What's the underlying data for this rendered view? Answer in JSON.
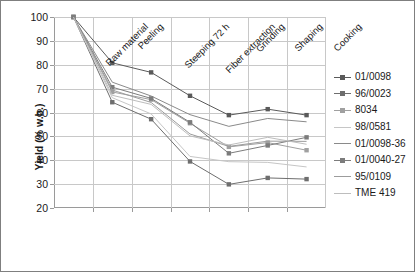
{
  "chart_data": {
    "type": "line",
    "title": "",
    "xlabel": "",
    "ylabel": "Yield (% w.b.)",
    "ylim": [
      20,
      100
    ],
    "ytick_step": 10,
    "yticks": [
      "100",
      "90",
      "80",
      "70",
      "60",
      "50",
      "40",
      "30",
      "20"
    ],
    "grid": true,
    "legend_position": "right",
    "categories": [
      "Raw material",
      "Peeling",
      "Steeping 72 h",
      "Fiber extraction",
      "Grinding",
      "Shaping",
      "Cooking"
    ],
    "series": [
      {
        "name": "01/0098",
        "color": "#5a5a5a",
        "marker": "square",
        "values": [
          100,
          80.8,
          76.8,
          67.0,
          58.9,
          61.4,
          58.9
        ]
      },
      {
        "name": "96/0023",
        "color": "#6e6e6e",
        "marker": "square",
        "values": [
          100,
          64.3,
          57.2,
          39.5,
          29.9,
          32.6,
          32.1
        ]
      },
      {
        "name": "8034",
        "color": "#a0a0a0",
        "marker": "square",
        "values": [
          100,
          68.6,
          65.4,
          55.5,
          45.6,
          47.4,
          44.2
        ]
      },
      {
        "name": "98/0581",
        "color": "#c6c6c6",
        "marker": "none",
        "values": [
          100,
          66.2,
          59.4,
          41.6,
          39.4,
          39.1,
          37.2
        ]
      },
      {
        "name": "01/0098-36",
        "color": "#8a8a8a",
        "marker": "none",
        "values": [
          100,
          72.7,
          66.9,
          59.1,
          54.2,
          57.5,
          56.1
        ]
      },
      {
        "name": "01/0040-27",
        "color": "#7c7c7c",
        "marker": "square",
        "values": [
          100,
          70.6,
          65.9,
          55.9,
          42.9,
          46.2,
          49.6
        ]
      },
      {
        "name": "95/0109",
        "color": "#9c9c9c",
        "marker": "none",
        "values": [
          100,
          69.4,
          64.2,
          51.0,
          45.8,
          48.0,
          47.9
        ]
      },
      {
        "name": "TME 419",
        "color": "#bdbdbd",
        "marker": "none",
        "values": [
          100,
          67.2,
          63.4,
          50.2,
          46.4,
          49.6,
          46.7
        ]
      }
    ]
  }
}
